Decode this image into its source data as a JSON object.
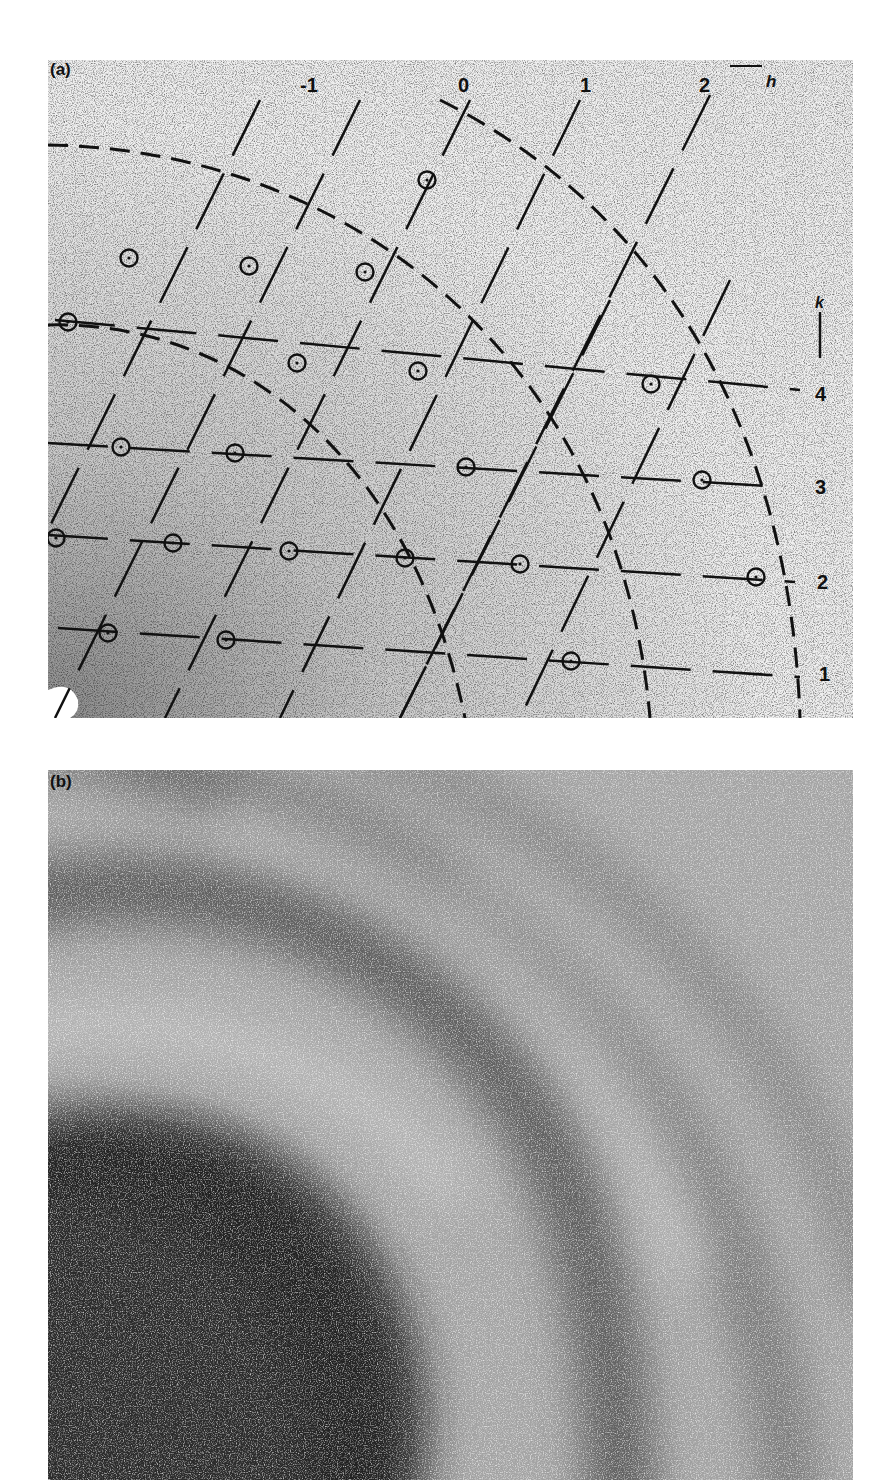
{
  "figure": {
    "panels": [
      {
        "id": "a",
        "label": "(a)",
        "h_axis_label": "h",
        "k_axis_label": "k",
        "h_indices": [
          "-1",
          "0",
          "1",
          "2"
        ],
        "k_indices": [
          "4",
          "3",
          "2",
          "1"
        ],
        "spots": [
          [
            145,
            18
          ],
          [
            427,
            180
          ],
          [
            129,
            258
          ],
          [
            249,
            266
          ],
          [
            365,
            272
          ],
          [
            68,
            322
          ],
          [
            297,
            363
          ],
          [
            418,
            371
          ],
          [
            651,
            384
          ],
          [
            121,
            447
          ],
          [
            235,
            453
          ],
          [
            466,
            467
          ],
          [
            702,
            480
          ],
          [
            56,
            538
          ],
          [
            173,
            543
          ],
          [
            289,
            551
          ],
          [
            405,
            558
          ],
          [
            520,
            564
          ],
          [
            756,
            577
          ],
          [
            108,
            633
          ],
          [
            226,
            640
          ],
          [
            571,
            661
          ]
        ],
        "description": "Indexed diffraction spots (circled) on an oblique reciprocal lattice with dashed rings"
      },
      {
        "id": "b",
        "label": "(b)",
        "description": "Diffuse diffraction pattern with concentric dark bands"
      }
    ]
  },
  "colors": {
    "ink": "#111111",
    "paper_a": "#eeeeee",
    "paper_b": "#9a9a9a"
  }
}
